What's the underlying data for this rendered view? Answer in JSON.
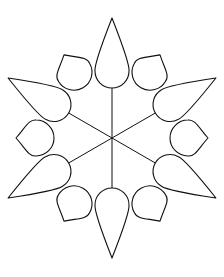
{
  "drawing": {
    "subject": "twelve-petal flower line art",
    "background": "#ffffff",
    "stroke": "#111111",
    "center": [
      112,
      138
    ],
    "outer_petals": {
      "count": 6,
      "angles": [
        90,
        30,
        330,
        270,
        210,
        150
      ],
      "tip_distance": 120,
      "base_distance": 50,
      "half_width": 17
    },
    "inner_petals": {
      "count": 6,
      "angles": [
        0,
        60,
        120,
        180,
        240,
        300
      ],
      "tip_distance": 96,
      "base_distance": 58,
      "half_width": 18
    }
  }
}
